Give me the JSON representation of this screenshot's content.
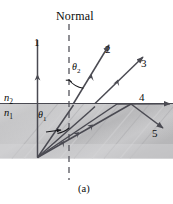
{
  "figure": {
    "caption": "(a)",
    "normal_label": "Normal",
    "media": {
      "upper_symbol": "n",
      "upper_subscript": "2",
      "lower_symbol": "n",
      "lower_subscript": "1"
    },
    "angles": [
      {
        "id": "theta2",
        "symbol": "θ",
        "subscript": "2"
      },
      {
        "id": "theta1",
        "symbol": "θ",
        "subscript": "1"
      }
    ],
    "ray_labels": [
      {
        "id": "ray-1",
        "text": "1"
      },
      {
        "id": "ray-2",
        "text": "2"
      },
      {
        "id": "ray-3",
        "text": "3"
      },
      {
        "id": "ray-4",
        "text": "4"
      },
      {
        "id": "ray-5",
        "text": "5"
      }
    ],
    "colors": {
      "ink": "#0b0b0b",
      "ray": "#4a4a52",
      "medium_fill": "#b9b9bb",
      "background": "#ffffff"
    }
  }
}
